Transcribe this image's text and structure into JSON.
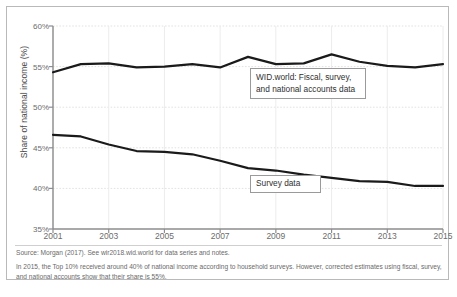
{
  "figure": {
    "source_note": "Source: Morgan (2017). See wir2018.wid.world for data series and notes.",
    "explanatory_note": "In 2015, the Top 10% received around 40% of national income according to household surveys. However, corrected estimates using fiscal, survey, and national accounts show that their share is 55%.",
    "callout_wid": "WID.world: Fiscal, survey,\nand national accounts data",
    "callout_survey": "Survey data"
  },
  "chart_data": {
    "type": "line",
    "title": "",
    "xlabel": "",
    "ylabel": "Share of national income (%)",
    "xlim": [
      2001,
      2015
    ],
    "ylim": [
      35,
      60
    ],
    "yticks": [
      "35%",
      "40%",
      "45%",
      "50%",
      "55%",
      "60%"
    ],
    "ytick_values": [
      35,
      40,
      45,
      50,
      55,
      60
    ],
    "xticks": [
      "2001",
      "2003",
      "2005",
      "2007",
      "2009",
      "2011",
      "2013",
      "2015"
    ],
    "xtick_values": [
      2001,
      2003,
      2005,
      2007,
      2009,
      2011,
      2013,
      2015
    ],
    "grid": true,
    "legend": "annotated-callouts",
    "x": [
      2001,
      2002,
      2003,
      2004,
      2005,
      2006,
      2007,
      2008,
      2009,
      2010,
      2011,
      2012,
      2013,
      2014,
      2015
    ],
    "series": [
      {
        "name": "WID.world: Fiscal, survey, and national accounts data",
        "color": "#1a1a1a",
        "values": [
          54.3,
          55.3,
          55.4,
          54.9,
          55.0,
          55.3,
          54.9,
          56.2,
          55.3,
          55.4,
          56.5,
          55.6,
          55.1,
          54.9,
          55.3
        ]
      },
      {
        "name": "Survey data",
        "color": "#1a1a1a",
        "values": [
          46.6,
          46.4,
          45.4,
          44.6,
          44.5,
          44.2,
          43.4,
          42.5,
          42.2,
          41.7,
          41.3,
          40.9,
          40.8,
          40.3,
          40.3
        ]
      }
    ]
  }
}
